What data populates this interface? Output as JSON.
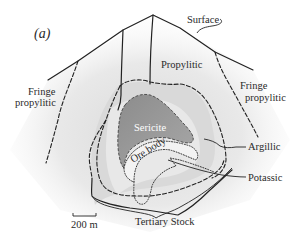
{
  "figure": {
    "panel_label": "(a)",
    "scale_bar": {
      "label": "200 m"
    },
    "labels": {
      "surface": "Surface",
      "propylitic": "Propylitic",
      "fringe_propylitic_left_line1": "Fringe",
      "fringe_propylitic_left_line2": "propylitic",
      "fringe_propylitic_right_line1": "Fringe",
      "fringe_propylitic_right_line2": "propylitic",
      "sericite": "Sericite",
      "ore_body": "Ore body",
      "argillic": "Argillic",
      "potassic": "Potassic",
      "tertiary_stock": "Tertiary Stock"
    },
    "colors": {
      "background": "#ffffff",
      "halo_light": "#ededed",
      "halo_mid": "#dcdcdc",
      "sericite_fill": "#9a9a9a",
      "ore_body_fill": "#f2f2f2",
      "line": "#222222"
    },
    "zones": [
      "Fringe propylitic",
      "Propylitic",
      "Argillic",
      "Sericite",
      "Ore body",
      "Potassic",
      "Tertiary Stock"
    ]
  }
}
